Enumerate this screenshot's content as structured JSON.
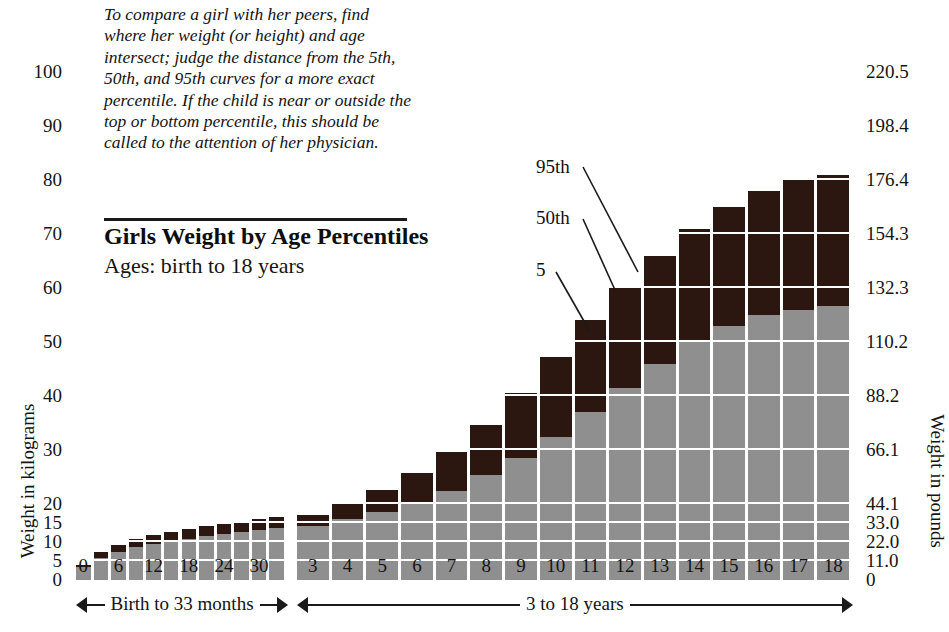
{
  "description": "To compare a girl with her peers, find where her weight (or height) and age intersect; judge the distance from the 5th, 50th, and 95th curves for a more exact percentile. If the child is near or outside the top or bottom percentile, this should be called to the attention of her physician.",
  "title": "Girls Weight by Age Percentiles",
  "subtitle": "Ages: birth to 18 years",
  "axis": {
    "left_title": "Weight in kilograms",
    "right_title": "Weight in pounds",
    "left_ticks": [
      "100",
      "90",
      "80",
      "70",
      "60",
      "50",
      "40",
      "30",
      "20",
      "15",
      "10",
      "5",
      "0"
    ],
    "right_ticks": [
      "220.5",
      "198.4",
      "176.4",
      "154.3",
      "132.3",
      "110.2",
      "88.2",
      "66.1",
      "44.1",
      "33.0",
      "22.0",
      "11.0",
      "0"
    ]
  },
  "callouts": {
    "p95": "95th",
    "p50": "50th",
    "p5": "5"
  },
  "ranges": {
    "months_label": "Birth to 33 months",
    "years_label": "3 to 18 years"
  },
  "colors": {
    "upper_band": "#2b1610",
    "lower_band": "#8f8f8f",
    "grid": "#ffffff",
    "text": "#141414"
  },
  "chart_data": {
    "type": "bar",
    "title": "Girls Weight by Age Percentiles",
    "subtitle": "Ages: birth to 18 years",
    "xlabel": "Age",
    "ylabel": "Weight in kilograms",
    "ylabel_secondary": "Weight in pounds",
    "ylim": [
      0,
      105
    ],
    "grid": true,
    "legend_position": "annotations-on-plot",
    "y_ticks_kg": [
      0,
      5,
      10,
      15,
      20,
      30,
      40,
      50,
      60,
      70,
      80,
      90,
      100
    ],
    "y_ticks_lb": [
      0,
      11.0,
      22.0,
      33.0,
      44.1,
      66.1,
      88.2,
      110.2,
      132.3,
      154.3,
      176.4,
      198.4,
      220.5
    ],
    "panels": [
      {
        "name": "Birth to 33 months",
        "x_tick_labels": [
          "0",
          "",
          "6",
          "",
          "12",
          "",
          "18",
          "",
          "24",
          "",
          "30",
          ""
        ],
        "categories": [
          "0",
          "3",
          "6",
          "9",
          "12",
          "15",
          "18",
          "21",
          "24",
          "27",
          "30",
          "33"
        ],
        "series": [
          {
            "name": "5th percentile",
            "values": [
              2.4,
              4.6,
              6.0,
              7.0,
              7.9,
              8.5,
              9.0,
              9.5,
              10.0,
              10.5,
              10.9,
              11.3
            ]
          },
          {
            "name": "50th percentile",
            "values": [
              3.4,
              5.8,
              7.3,
              8.6,
              9.5,
              10.3,
              10.8,
              11.5,
              12.0,
              12.6,
              13.2,
              13.7
            ]
          },
          {
            "name": "95th percentile",
            "values": [
              4.0,
              7.3,
              9.3,
              10.8,
              11.8,
              12.6,
              13.3,
              14.1,
              14.8,
              15.4,
              16.0,
              16.5
            ]
          }
        ]
      },
      {
        "name": "3 to 18 years",
        "x_tick_labels": [
          "3",
          "4",
          "5",
          "6",
          "7",
          "8",
          "9",
          "10",
          "11",
          "12",
          "13",
          "14",
          "15",
          "16",
          "17",
          "18"
        ],
        "categories": [
          "3",
          "4",
          "5",
          "6",
          "7",
          "8",
          "9",
          "10",
          "11",
          "12",
          "13",
          "14",
          "15",
          "16",
          "17",
          "18"
        ],
        "series": [
          {
            "name": "5th percentile",
            "values": [
              11.6,
              13.1,
              14.6,
              16.1,
              17.8,
              19.6,
              21.5,
              23.8,
              26.7,
              30.0,
              33.5,
              37.0,
              40.0,
              42.0,
              43.5,
              44.5
            ]
          },
          {
            "name": "50th percentile",
            "values": [
              14.1,
              16.0,
              18.0,
              20.0,
              22.4,
              25.3,
              28.5,
              32.5,
              37.0,
              41.5,
              46.0,
              50.0,
              53.0,
              55.0,
              56.0,
              56.6
            ]
          },
          {
            "name": "95th percentile",
            "values": [
              17.2,
              19.9,
              22.6,
              25.8,
              29.7,
              34.7,
              40.6,
              47.2,
              54.0,
              60.0,
              66.0,
              71.0,
              75.0,
              78.0,
              80.0,
              81.0
            ]
          }
        ]
      }
    ]
  }
}
